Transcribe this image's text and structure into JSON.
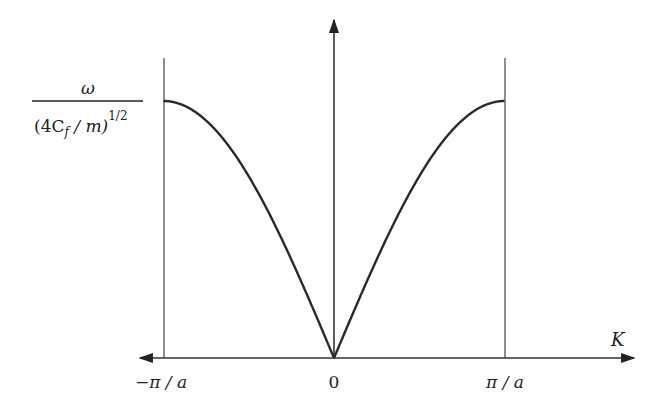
{
  "diagram": {
    "colors": {
      "line": "#333333",
      "curve": "#2a2a2a",
      "background": "#ffffff"
    },
    "y_axis_label": {
      "numerator": "ω",
      "denominator_open": "(4C",
      "denominator_sub": "f",
      "denominator_mid": " / m)",
      "denominator_sup": "1/2"
    },
    "x_axis_label": "K",
    "ticks": [
      {
        "label": "−π / a",
        "value": -1
      },
      {
        "label": "0",
        "value": 0
      },
      {
        "label": "π / a",
        "value": 1
      }
    ],
    "curve": {
      "description": "|sin(Ka/2)| normalized, max 1 at K = ±π/a, 0 at K = 0",
      "formula": "ω/(4C_f/m)^{1/2} = |sin(Ka/2)|"
    },
    "boundary_lines": [
      "−π/a",
      "π/a"
    ]
  },
  "chart_data": {
    "type": "line",
    "title": "",
    "xlabel": "K",
    "ylabel": "ω / (4C_f / m)^{1/2}",
    "x_ticks": [
      "−π/a",
      "0",
      "π/a"
    ],
    "xlim": [
      -1,
      1
    ],
    "ylim": [
      0,
      1
    ],
    "series": [
      {
        "name": "|sin(Ka/2)|",
        "x": [
          -1,
          -0.75,
          -0.5,
          -0.25,
          0,
          0.25,
          0.5,
          0.75,
          1
        ],
        "y": [
          1.0,
          0.924,
          0.707,
          0.383,
          0,
          0.383,
          0.707,
          0.924,
          1.0
        ]
      }
    ]
  }
}
